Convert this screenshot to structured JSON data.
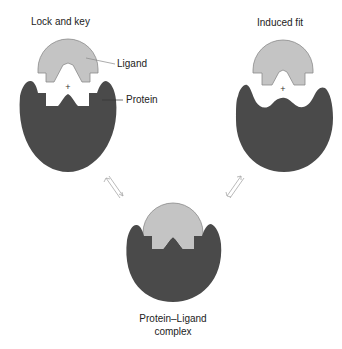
{
  "panels": {
    "lock_and_key": {
      "title": "Lock and key",
      "labels": {
        "ligand": "Ligand",
        "protein": "Protein"
      },
      "plus": "+"
    },
    "induced_fit": {
      "title": "Induced fit",
      "plus": "+"
    },
    "complex": {
      "label_line1": "Protein–Ligand",
      "label_line2": "complex"
    }
  },
  "arrows": {
    "left": "equilibrium-arrow",
    "right": "equilibrium-arrow"
  },
  "colors": {
    "protein": "#4a4a4a",
    "ligand": "#c4c4c4",
    "ligand_stroke": "#8a8a8a",
    "text": "#222222",
    "arrow": "#a0a0a0",
    "background": "#ffffff"
  }
}
